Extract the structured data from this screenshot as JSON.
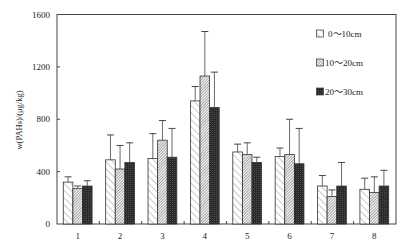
{
  "chart_data": {
    "type": "bar",
    "title": "",
    "xlabel": "",
    "ylabel": "w(PAHs)/(μg/kg)",
    "ylim": [
      0,
      1600
    ],
    "yticks": [
      0,
      400,
      800,
      1200,
      1600
    ],
    "grid": false,
    "legend_position": "upper right (inside)",
    "categories": [
      "1",
      "2",
      "3",
      "4",
      "5",
      "6",
      "7",
      "8"
    ],
    "series": [
      {
        "name": "0～10cm",
        "pattern": "sparse-diagonal-hatch",
        "values": [
          320,
          490,
          500,
          940,
          550,
          515,
          290,
          265
        ],
        "error_upper": [
          360,
          680,
          690,
          1050,
          610,
          580,
          370,
          350
        ]
      },
      {
        "name": "10～20cm",
        "pattern": "dense-diagonal-hatch",
        "values": [
          270,
          420,
          640,
          1130,
          530,
          530,
          210,
          240
        ],
        "error_upper": [
          290,
          600,
          790,
          1470,
          620,
          800,
          260,
          360
        ]
      },
      {
        "name": "20～30cm",
        "pattern": "dark-fill",
        "values": [
          290,
          470,
          510,
          890,
          470,
          460,
          290,
          290
        ],
        "error_upper": [
          330,
          620,
          730,
          1160,
          510,
          730,
          470,
          410
        ]
      }
    ]
  },
  "colors": {
    "axis": "#444444",
    "bar_outline": "#333333",
    "hatch": "#555555",
    "dark_fill": "#2b2b2b",
    "background": "#ffffff"
  }
}
